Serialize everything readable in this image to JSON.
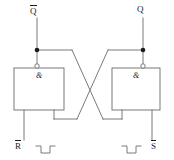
{
  "diagram": {
    "type": "logic-circuit-schematic",
    "line_color": "#6b6b6b",
    "node_color": "#1a1a1a",
    "text_color": "#1a1a1a",
    "background": "#ffffff"
  },
  "outputs": [
    {
      "id": "q-bar",
      "label": "Q",
      "overbar": true,
      "side": "left"
    },
    {
      "id": "q",
      "label": "Q",
      "overbar": false,
      "side": "right"
    }
  ],
  "inputs": [
    {
      "id": "r-bar",
      "label": "R",
      "overbar": true,
      "side": "left",
      "waveform": "negative-pulse"
    },
    {
      "id": "s-bar",
      "label": "S",
      "overbar": true,
      "side": "right",
      "waveform": "negative-pulse"
    }
  ],
  "gates": [
    {
      "id": "gate-left",
      "symbol": "&",
      "function": "NAND",
      "inverting_bubble": true
    },
    {
      "id": "gate-right",
      "symbol": "&",
      "function": "NAND",
      "inverting_bubble": true
    }
  ],
  "nodes": [
    {
      "id": "junction-left",
      "x": 37,
      "y": 50
    },
    {
      "id": "junction-right",
      "x": 143,
      "y": 50
    }
  ]
}
